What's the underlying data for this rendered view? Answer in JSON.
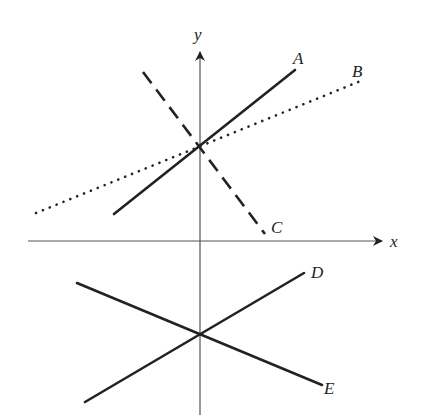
{
  "diagram": {
    "title": "",
    "colors": {
      "axis": "#555555",
      "line": "#222222",
      "background": "#ffffff"
    },
    "axes": {
      "x_label": "x",
      "y_label": "y",
      "x_axis": {
        "x1": 28,
        "y1": 241,
        "x2": 382,
        "y2": 241
      },
      "y_axis": {
        "x1": 200,
        "y1": 415,
        "x2": 200,
        "y2": 52
      }
    },
    "lines": [
      {
        "label": "A",
        "style": "solid",
        "x1": 114,
        "y1": 214,
        "x2": 295,
        "y2": 70,
        "label_x": 293,
        "label_y": 64
      },
      {
        "label": "B",
        "style": "dotted",
        "x1": 36,
        "y1": 213,
        "x2": 363,
        "y2": 80,
        "label_x": 352,
        "label_y": 77
      },
      {
        "label": "C",
        "style": "dashed",
        "x1": 143,
        "y1": 72,
        "x2": 265,
        "y2": 234,
        "label_x": 271,
        "label_y": 233
      },
      {
        "label": "D",
        "style": "solid",
        "x1": 85,
        "y1": 402,
        "x2": 304,
        "y2": 273,
        "label_x": 311,
        "label_y": 278
      },
      {
        "label": "E",
        "style": "solid",
        "x1": 77,
        "y1": 283,
        "x2": 322,
        "y2": 385,
        "label_x": 324,
        "label_y": 394
      }
    ],
    "intersections": [
      {
        "lines": [
          "A",
          "B",
          "C"
        ],
        "x": 200,
        "y": 148
      },
      {
        "lines": [
          "D",
          "E"
        ],
        "x": 200,
        "y": 334
      }
    ]
  }
}
